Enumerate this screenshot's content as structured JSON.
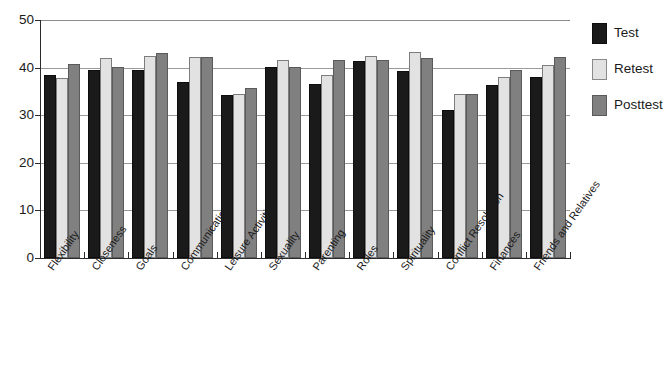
{
  "chart_data": {
    "type": "bar",
    "title": "",
    "subtitle": "",
    "xlabel": "",
    "ylabel": "",
    "ylim": [
      0,
      50
    ],
    "yticks": [
      0,
      10,
      20,
      30,
      40,
      50
    ],
    "grid": "horizontal",
    "legend_position": "right",
    "categories": [
      "Flexibility",
      "Closeness",
      "Goals",
      "Communication",
      "Leisure Activities",
      "Sexuality",
      "Parenting",
      "Roles",
      "Spirituality",
      "Conflict Resolution",
      "Finances",
      "Friends and Relatives"
    ],
    "series": [
      {
        "name": "Test",
        "color": "#1a1a1a",
        "values": [
          38.5,
          39.5,
          39.4,
          36.9,
          34.2,
          40.1,
          36.5,
          41.3,
          39.3,
          31.0,
          36.4,
          38.0
        ]
      },
      {
        "name": "Retest",
        "color": "#e2e2e2",
        "values": [
          37.8,
          42.0,
          42.5,
          42.2,
          34.5,
          41.5,
          38.5,
          42.5,
          43.3,
          34.5,
          38.0,
          40.5
        ]
      },
      {
        "name": "Posttest",
        "color": "#808080",
        "values": [
          40.8,
          40.2,
          43.0,
          42.2,
          35.7,
          40.1,
          41.5,
          41.5,
          42.1,
          34.4,
          39.5,
          42.3
        ]
      }
    ]
  },
  "legend": {
    "items": [
      {
        "label": "Test",
        "key": "test"
      },
      {
        "label": "Retest",
        "key": "retest"
      },
      {
        "label": "Posttest",
        "key": "posttest"
      }
    ]
  }
}
